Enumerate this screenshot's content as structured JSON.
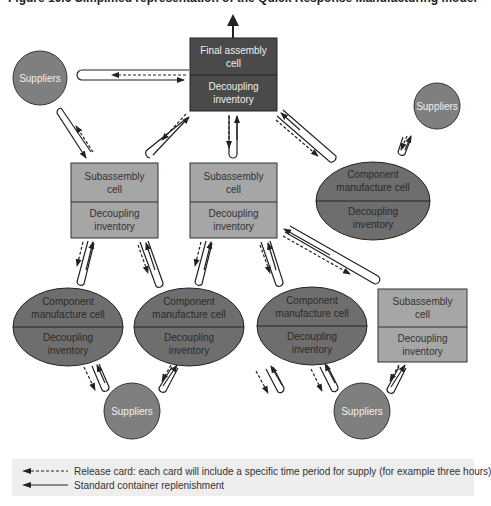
{
  "figure": {
    "caption": "Figure 10.6 Simplified representation of the Quick Response Manufacturing model"
  },
  "colors": {
    "final_cell": "#4a4a4a",
    "subassembly": "#a6a6a6",
    "component": "#6e6e6e",
    "suppliers": "#7f7f7f",
    "line": "#222222",
    "legend_bg": "#eeeeee"
  },
  "nodes": {
    "final_assembly": {
      "top": "Final assembly cell",
      "top_l1": "Final assembly",
      "top_l2": "cell",
      "bottom_l1": "Decoupling",
      "bottom_l2": "inventory"
    },
    "sub_left": {
      "top_l1": "Subassembly",
      "top_l2": "cell",
      "bottom_l1": "Decoupling",
      "bottom_l2": "inventory"
    },
    "sub_middle": {
      "top_l1": "Subassembly",
      "top_l2": "cell",
      "bottom_l1": "Decoupling",
      "bottom_l2": "inventory"
    },
    "sub_right": {
      "top_l1": "Subassembly",
      "top_l2": "cell",
      "bottom_l1": "Decoupling",
      "bottom_l2": "inventory"
    },
    "comp_top_right": {
      "top_l1": "Component",
      "top_l2": "manufacture cell",
      "bottom_l1": "Decoupling",
      "bottom_l2": "inventory"
    },
    "comp_bottom_1": {
      "top_l1": "Component",
      "top_l2": "manufacture cell",
      "bottom_l1": "Decoupling",
      "bottom_l2": "inventory"
    },
    "comp_bottom_2": {
      "top_l1": "Component",
      "top_l2": "manufacture cell",
      "bottom_l1": "Decoupling",
      "bottom_l2": "inventory"
    },
    "comp_bottom_3": {
      "top_l1": "Component",
      "top_l2": "manufacture cell",
      "bottom_l1": "Decoupling",
      "bottom_l2": "inventory"
    },
    "suppliers_top_left": {
      "label": "Suppliers"
    },
    "suppliers_top_right": {
      "label": "Suppliers"
    },
    "suppliers_bottom_left": {
      "label": "Suppliers"
    },
    "suppliers_bottom_right": {
      "label": "Suppliers"
    }
  },
  "legend": {
    "release_card": "Release card: each card will include a specific time period for supply (for example three hours)",
    "standard_container": "Standard container replenishment"
  }
}
